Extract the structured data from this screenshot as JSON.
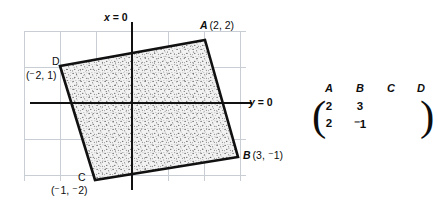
{
  "figure": {
    "axis_labels": {
      "x_axis": "x = 0",
      "y_axis": "y = 0"
    },
    "vertices": [
      {
        "name": "A",
        "label": "A",
        "coord_text": "(2, 2)",
        "x": 2,
        "y": 2,
        "px": 205,
        "py": 40
      },
      {
        "name": "B",
        "label": "B",
        "coord_text": "(3, ⁻1)",
        "x": 3,
        "y": -1,
        "px": 238,
        "py": 157
      },
      {
        "name": "C",
        "label": "C",
        "coord_text": "(⁻1, ⁻2)",
        "x": -1,
        "y": -2,
        "px": 95,
        "py": 180
      },
      {
        "name": "D",
        "label": "D",
        "coord_text": "(⁻2, 1)",
        "x": -2,
        "y": 1,
        "px": 60,
        "py": 66
      }
    ],
    "shape": {
      "type": "quadrilateral",
      "fill": "stipple",
      "order": "A-B-C-D"
    },
    "grid": {
      "visible": true,
      "color": "#c9cdd4",
      "spacing_px": 36
    },
    "axes": {
      "color": "#111111",
      "origin_px": {
        "x": 132,
        "y": 103
      }
    }
  },
  "matrix": {
    "column_headers": [
      "A",
      "B",
      "C",
      "D"
    ],
    "rows": [
      [
        "2",
        "3",
        "",
        ""
      ],
      [
        "2",
        "⁻1",
        "",
        ""
      ]
    ],
    "bracket_left": "(",
    "bracket_right": ")"
  }
}
